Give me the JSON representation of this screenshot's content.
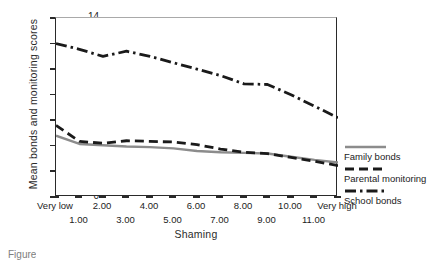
{
  "chart_data": {
    "type": "line",
    "title": "",
    "xlabel": "Shaming",
    "ylabel": "Mean bonds and monitoring scores",
    "xlim": [
      0,
      12
    ],
    "ylim": [
      0,
      14
    ],
    "grid": false,
    "legend_position": "right",
    "x": [
      0,
      1,
      2,
      3,
      4,
      5,
      6,
      7,
      8,
      9,
      10,
      11,
      12
    ],
    "x_tick_labels": [
      "Very low",
      "1.00",
      "2.00",
      "3.00",
      "4.00",
      "5.00",
      "6.00",
      "7.00",
      "8.00",
      "9.00",
      "10.00",
      "11.00",
      "Very high"
    ],
    "y_tick_labels": [
      "0",
      "2",
      "4",
      "6",
      "8",
      "10",
      "12",
      "14"
    ],
    "y_ticks": [
      0,
      2,
      4,
      6,
      8,
      10,
      12,
      14
    ],
    "series": [
      {
        "name": "Family bonds",
        "style": "solid",
        "color": "#8c8c8c",
        "values": [
          4.8,
          4.15,
          4.05,
          3.95,
          3.9,
          3.8,
          3.6,
          3.5,
          3.45,
          3.4,
          3.15,
          2.9,
          2.7
        ]
      },
      {
        "name": "Parental monitoring",
        "style": "dashed",
        "color": "#1a1a1a",
        "values": [
          5.6,
          4.35,
          4.2,
          4.4,
          4.35,
          4.3,
          4.1,
          3.75,
          3.5,
          3.4,
          3.1,
          2.8,
          2.45
        ]
      },
      {
        "name": "School bonds",
        "style": "dash-dot",
        "color": "#1a1a1a",
        "values": [
          12.0,
          11.55,
          11.0,
          11.4,
          11.0,
          10.5,
          10.0,
          9.5,
          8.85,
          8.8,
          8.0,
          7.1,
          6.2
        ]
      }
    ]
  },
  "legend": {
    "items": [
      {
        "label": "Family bonds",
        "swatch": "solid-gray-line-swatch"
      },
      {
        "label": "Parental monitoring",
        "swatch": "dashed-black-line-swatch"
      },
      {
        "label": "School bonds",
        "swatch": "dash-dot-black-line-swatch"
      }
    ]
  },
  "caption": {
    "text": "Figure"
  }
}
